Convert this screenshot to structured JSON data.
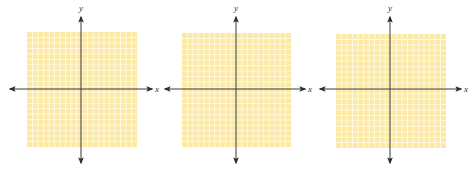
{
  "figure": {
    "colors": {
      "background": "#ffffff",
      "grid_fill": "#fbeaa6",
      "grid_line": "#fff8e6",
      "axis": "#3a3a34"
    },
    "planes": [
      {
        "id": "plane-1",
        "grid": {
          "x": 27,
          "y": 32,
          "width": 110,
          "height": 115,
          "cols": 20,
          "rows": 21
        },
        "origin": {
          "x": 81,
          "y": 89
        },
        "x_axis": {
          "from": 10,
          "to": 152,
          "label": "x"
        },
        "y_axis": {
          "from": 17,
          "to": 163,
          "label": "y"
        }
      },
      {
        "id": "plane-2",
        "grid": {
          "x": 182,
          "y": 33,
          "width": 109,
          "height": 114,
          "cols": 20,
          "rows": 21
        },
        "origin": {
          "x": 236,
          "y": 89
        },
        "x_axis": {
          "from": 165,
          "to": 305,
          "label": "x"
        },
        "y_axis": {
          "from": 17,
          "to": 163,
          "label": "y"
        }
      },
      {
        "id": "plane-3",
        "grid": {
          "x": 336,
          "y": 34,
          "width": 110,
          "height": 114,
          "cols": 20,
          "rows": 21
        },
        "origin": {
          "x": 390,
          "y": 89
        },
        "x_axis": {
          "from": 320,
          "to": 461,
          "label": "x"
        },
        "y_axis": {
          "from": 17,
          "to": 163,
          "label": "y"
        }
      }
    ]
  }
}
